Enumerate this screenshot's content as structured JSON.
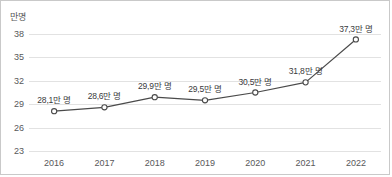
{
  "chart_data": {
    "type": "line",
    "title": "",
    "subtitle": "",
    "unit_label": "만명",
    "xlabel": "",
    "ylabel": "",
    "categories": [
      "2016",
      "2017",
      "2018",
      "2019",
      "2020",
      "2021",
      "2022"
    ],
    "values": [
      28.1,
      28.6,
      29.9,
      29.5,
      30.5,
      31.8,
      37.3
    ],
    "point_labels": [
      "28,1만 명",
      "28,6만 명",
      "29,9만 명",
      "29,5만 명",
      "30,5만 명",
      "31,8만 명",
      "37,3만 명"
    ],
    "yticks": [
      38,
      35,
      32,
      29,
      26,
      23
    ],
    "ytick_labels": [
      "38",
      "35",
      "32",
      "29",
      "26",
      "23"
    ],
    "ylim": [
      23,
      38
    ],
    "grid": true,
    "grid_axis": "y",
    "legend": false,
    "legend_position": "none",
    "series": [
      {
        "name": "",
        "values": [
          28.1,
          28.6,
          29.9,
          29.5,
          30.5,
          31.8,
          37.3
        ],
        "line_color": "#4a4a4a",
        "marker": "open-circle",
        "marker_fill": "#ffffff",
        "marker_stroke": "#4a4a4a"
      }
    ],
    "colors": {
      "line": "#4a4a4a",
      "marker_fill": "#ffffff",
      "marker_stroke": "#4a4a4a",
      "gridline": "#e2e2e2",
      "axis_text": "#58585a",
      "label_text": "#3a3a3c",
      "border": "#c9c9c9",
      "background": "#ffffff"
    }
  }
}
